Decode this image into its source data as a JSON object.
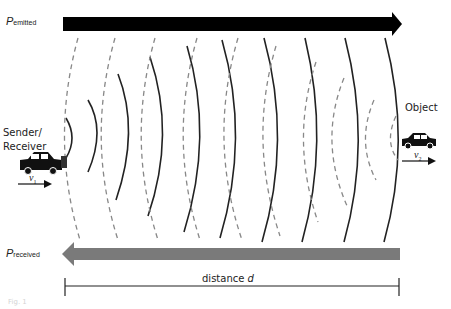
{
  "diagram": {
    "emitted_label": {
      "main": "P",
      "sub": "emitted"
    },
    "received_label": {
      "main": "P",
      "sub": "received"
    },
    "sender_label_line1": "Sender/",
    "sender_label_line2": "Receiver",
    "object_label": "Object",
    "v1": {
      "main": "v",
      "sub": "1"
    },
    "v2": {
      "main": "v",
      "sub": "2"
    },
    "distance_label": "distance ",
    "distance_var": "d",
    "caption": "Fig. 1",
    "colors": {
      "emitted_arrow": "#000000",
      "received_arrow": "#7a7a7a",
      "solid_wave": "#222222",
      "dashed_wave": "#888888"
    }
  }
}
